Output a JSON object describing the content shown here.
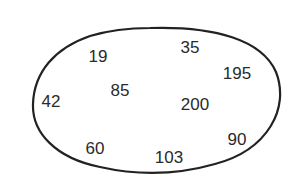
{
  "diagram": {
    "type": "set-oval",
    "outline_color": "#222222",
    "text_color": "#2a2a2a",
    "elements": [
      {
        "value": "19",
        "x": 98,
        "y": 56
      },
      {
        "value": "35",
        "x": 190,
        "y": 47
      },
      {
        "value": "195",
        "x": 237,
        "y": 73
      },
      {
        "value": "42",
        "x": 51,
        "y": 101
      },
      {
        "value": "85",
        "x": 120,
        "y": 90
      },
      {
        "value": "200",
        "x": 195,
        "y": 104
      },
      {
        "value": "90",
        "x": 237,
        "y": 139
      },
      {
        "value": "60",
        "x": 95,
        "y": 148
      },
      {
        "value": "103",
        "x": 169,
        "y": 157
      }
    ]
  }
}
